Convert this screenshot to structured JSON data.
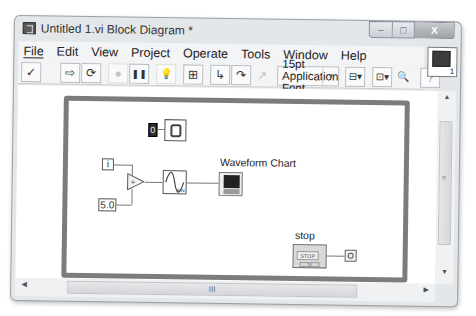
{
  "window": {
    "title": "Untitled 1.vi Block Diagram *",
    "controls": {
      "minimize": "–",
      "maximize": "□",
      "close": "X"
    }
  },
  "menubar": {
    "items": [
      {
        "label": "File",
        "mnemonic": "F"
      },
      {
        "label": "Edit",
        "mnemonic": "E"
      },
      {
        "label": "View",
        "mnemonic": "V"
      },
      {
        "label": "Project",
        "mnemonic": "P"
      },
      {
        "label": "Operate",
        "mnemonic": "O"
      },
      {
        "label": "Tools",
        "mnemonic": "T"
      },
      {
        "label": "Window",
        "mnemonic": "W"
      },
      {
        "label": "Help",
        "mnemonic": "H"
      }
    ]
  },
  "toolbar": {
    "run": "✓",
    "run_continuously": "⇨",
    "run_all": "⟳",
    "abort": "●",
    "pause": "❚❚",
    "highlight_execution": "💡",
    "retain_wire_values": "⊞",
    "step_into": "↳",
    "step_over": "↷",
    "step_out": "↗",
    "font": "15pt Application Font",
    "font_dropdown": "▾",
    "align": "⊟▾",
    "distribute": "⊡▾",
    "zoom": "🔍",
    "help": "?"
  },
  "vi_icon": {
    "number": "1"
  },
  "diagram": {
    "constant_zero": "0",
    "iteration_terminal": "i",
    "divisor_constant": "5.0",
    "divide_symbol": "÷",
    "sine_label": "SIN",
    "waveform_chart_label": "Waveform Chart",
    "stop_label": "stop",
    "stop_button_text": "STOP",
    "stop_type": "TF"
  },
  "scrollbars": {
    "h_grip": "III",
    "v_grip": "≡",
    "up": "▲",
    "down": "▼",
    "left": "◀",
    "right": "▶"
  }
}
